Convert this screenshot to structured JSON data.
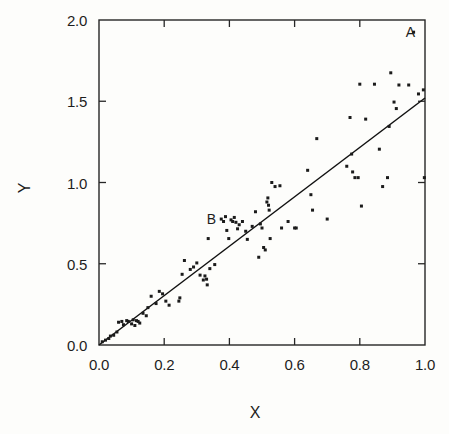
{
  "figure": {
    "background_color": "#fdfdfb",
    "ink_color": "#1b1b1b"
  },
  "axis_titles": {
    "x": "X",
    "y": "Y"
  },
  "annotations": [
    {
      "text": "A",
      "x": 0.955,
      "y": 1.925
    },
    {
      "text": "B",
      "x": 0.345,
      "y": 0.775
    }
  ],
  "chart_data": {
    "type": "scatter",
    "title": "",
    "subtitle": "",
    "xlabel": "X",
    "ylabel": "Y",
    "xlim": [
      0.0,
      1.0
    ],
    "ylim": [
      0.0,
      2.0
    ],
    "xticks": [
      0.0,
      0.2,
      0.4,
      0.6,
      0.8,
      1.0
    ],
    "yticks": [
      0.0,
      0.5,
      1.0,
      1.5,
      2.0
    ],
    "xticklabels": [
      "0.0",
      "0.2",
      "0.4",
      "0.6",
      "0.8",
      "1.0"
    ],
    "yticklabels": [
      "0.0",
      "0.5",
      "1.0",
      "1.5",
      "2.0"
    ],
    "grid": false,
    "legend": false,
    "legend_position": "none",
    "marker": "square-dot",
    "marker_size": 3,
    "fit_line": {
      "name": "regression line",
      "type": "line",
      "slope": 1.52,
      "intercept": 0.0,
      "x": [
        0.0,
        1.0
      ],
      "y": [
        0.0,
        1.52
      ]
    },
    "series": [
      {
        "name": "observations",
        "points": [
          [
            0.01,
            0.02
          ],
          [
            0.02,
            0.03
          ],
          [
            0.03,
            0.04
          ],
          [
            0.035,
            0.055
          ],
          [
            0.045,
            0.06
          ],
          [
            0.055,
            0.08
          ],
          [
            0.06,
            0.14
          ],
          [
            0.07,
            0.145
          ],
          [
            0.075,
            0.125
          ],
          [
            0.085,
            0.15
          ],
          [
            0.09,
            0.145
          ],
          [
            0.1,
            0.13
          ],
          [
            0.105,
            0.155
          ],
          [
            0.11,
            0.12
          ],
          [
            0.115,
            0.15
          ],
          [
            0.12,
            0.145
          ],
          [
            0.125,
            0.135
          ],
          [
            0.135,
            0.195
          ],
          [
            0.145,
            0.18
          ],
          [
            0.15,
            0.23
          ],
          [
            0.16,
            0.3
          ],
          [
            0.175,
            0.255
          ],
          [
            0.185,
            0.33
          ],
          [
            0.195,
            0.315
          ],
          [
            0.205,
            0.27
          ],
          [
            0.215,
            0.245
          ],
          [
            0.245,
            0.27
          ],
          [
            0.248,
            0.29
          ],
          [
            0.255,
            0.435
          ],
          [
            0.262,
            0.52
          ],
          [
            0.28,
            0.465
          ],
          [
            0.29,
            0.48
          ],
          [
            0.3,
            0.505
          ],
          [
            0.31,
            0.43
          ],
          [
            0.32,
            0.4
          ],
          [
            0.325,
            0.425
          ],
          [
            0.33,
            0.405
          ],
          [
            0.332,
            0.37
          ],
          [
            0.335,
            0.655
          ],
          [
            0.34,
            0.47
          ],
          [
            0.355,
            0.495
          ],
          [
            0.375,
            0.775
          ],
          [
            0.382,
            0.76
          ],
          [
            0.388,
            0.79
          ],
          [
            0.392,
            0.705
          ],
          [
            0.398,
            0.655
          ],
          [
            0.405,
            0.77
          ],
          [
            0.41,
            0.76
          ],
          [
            0.415,
            0.785
          ],
          [
            0.42,
            0.755
          ],
          [
            0.425,
            0.715
          ],
          [
            0.43,
            0.74
          ],
          [
            0.44,
            0.76
          ],
          [
            0.45,
            0.7
          ],
          [
            0.455,
            0.65
          ],
          [
            0.47,
            0.73
          ],
          [
            0.48,
            0.82
          ],
          [
            0.49,
            0.54
          ],
          [
            0.495,
            0.745
          ],
          [
            0.5,
            0.72
          ],
          [
            0.505,
            0.6
          ],
          [
            0.51,
            0.585
          ],
          [
            0.515,
            0.88
          ],
          [
            0.518,
            0.905
          ],
          [
            0.52,
            0.86
          ],
          [
            0.522,
            0.83
          ],
          [
            0.525,
            0.655
          ],
          [
            0.53,
            1.0
          ],
          [
            0.54,
            0.975
          ],
          [
            0.555,
            0.98
          ],
          [
            0.56,
            0.72
          ],
          [
            0.58,
            0.76
          ],
          [
            0.6,
            0.72
          ],
          [
            0.605,
            0.72
          ],
          [
            0.64,
            1.075
          ],
          [
            0.65,
            0.925
          ],
          [
            0.655,
            0.83
          ],
          [
            0.668,
            1.27
          ],
          [
            0.7,
            0.775
          ],
          [
            0.76,
            1.1
          ],
          [
            0.77,
            1.4
          ],
          [
            0.775,
            1.175
          ],
          [
            0.778,
            1.065
          ],
          [
            0.785,
            1.03
          ],
          [
            0.795,
            1.03
          ],
          [
            0.8,
            1.605
          ],
          [
            0.805,
            0.855
          ],
          [
            0.818,
            1.39
          ],
          [
            0.845,
            1.605
          ],
          [
            0.86,
            1.205
          ],
          [
            0.87,
            0.975
          ],
          [
            0.885,
            1.03
          ],
          [
            0.89,
            1.345
          ],
          [
            0.895,
            1.675
          ],
          [
            0.905,
            1.495
          ],
          [
            0.912,
            1.455
          ],
          [
            0.92,
            1.6
          ],
          [
            0.95,
            1.6
          ],
          [
            0.965,
            1.925
          ],
          [
            0.98,
            1.545
          ],
          [
            0.995,
            1.57
          ],
          [
            0.998,
            1.03
          ]
        ]
      }
    ]
  }
}
